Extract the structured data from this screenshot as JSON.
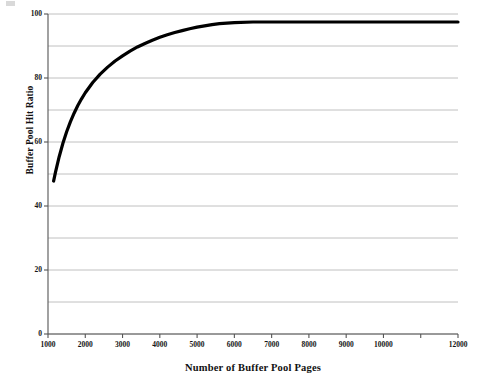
{
  "chart_data": {
    "type": "line",
    "title": "",
    "xlabel": "Number of Buffer Pool Pages",
    "ylabel": "Buffer Pool Hit Ratio",
    "xlim": [
      1000,
      12000
    ],
    "ylim": [
      0,
      100
    ],
    "grid": true,
    "grid_axis": "y",
    "legend": "none",
    "xticks": [
      1000,
      2000,
      3000,
      4000,
      5000,
      6000,
      7000,
      8000,
      9000,
      10000,
      11000,
      12000
    ],
    "xtick_labels": [
      "1000",
      "2000",
      "3000",
      "4000",
      "5000",
      "6000",
      "7000",
      "8000",
      "9000",
      "10000",
      "11000",
      "12000"
    ],
    "xtick_labels_shown": [
      "1000",
      "2000",
      "3000",
      "4000",
      "5000",
      "6000",
      "7000",
      "8000",
      "9000",
      "10000",
      "12000"
    ],
    "yticks": [
      0,
      10,
      20,
      30,
      40,
      50,
      60,
      70,
      80,
      90,
      100
    ],
    "ytick_labels_shown": [
      "0",
      "20",
      "40",
      "60",
      "80",
      "100"
    ],
    "line_color": "#000000",
    "line_width": 3.2,
    "grid_color": "#b0b0b0",
    "axis_color": "#555555",
    "series": [
      {
        "name": "Buffer Pool Hit Ratio",
        "x": [
          1150,
          1200,
          1300,
          1400,
          1500,
          1600,
          1700,
          1800,
          1900,
          2000,
          2200,
          2400,
          2600,
          2800,
          3000,
          3200,
          3400,
          3600,
          3800,
          4000,
          4200,
          4400,
          4600,
          4800,
          5000,
          5200,
          5400,
          5600,
          6000,
          6500,
          7000,
          7500,
          8000,
          8500,
          9000,
          9500,
          10000,
          10500,
          11000,
          11500,
          12000
        ],
        "y": [
          47.8,
          50.5,
          55.4,
          59.6,
          63.2,
          66.3,
          69.0,
          71.4,
          73.5,
          75.4,
          78.6,
          81.2,
          83.4,
          85.3,
          86.9,
          88.4,
          89.7,
          90.8,
          91.8,
          92.7,
          93.5,
          94.2,
          94.8,
          95.4,
          95.9,
          96.3,
          96.7,
          97.0,
          97.3,
          97.5,
          97.5,
          97.5,
          97.5,
          97.5,
          97.5,
          97.5,
          97.5,
          97.5,
          97.5,
          97.5,
          97.5
        ]
      }
    ]
  },
  "axes": {
    "y_title": "Buffer Pool Hit Ratio",
    "x_title": "Number of Buffer Pool Pages"
  }
}
